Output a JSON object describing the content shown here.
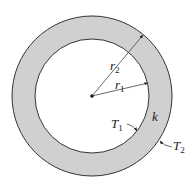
{
  "diagram": {
    "type": "cylindrical-shell-cross-section",
    "colors": {
      "background": "#ffffff",
      "shell_fill": "#d0d0d0",
      "stroke": "#333333",
      "leader": "#555555"
    },
    "labels": {
      "outer_radius": {
        "main": "r",
        "sub": "2"
      },
      "inner_radius": {
        "main": "r",
        "sub": "1"
      },
      "inner_temperature": {
        "main": "T",
        "sub": "1"
      },
      "outer_temperature": {
        "main": "T",
        "sub": "2"
      },
      "conductivity": {
        "main": "k"
      }
    }
  }
}
